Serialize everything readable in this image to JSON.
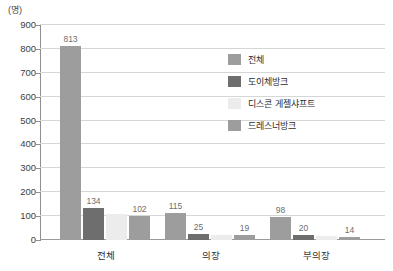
{
  "chart_data": {
    "type": "bar",
    "title": "",
    "subtitle": "",
    "unit_label": "(명)",
    "xlabel": "",
    "ylabel": "",
    "ylim": [
      0,
      900
    ],
    "ytick_step": 100,
    "grid": true,
    "legend_position": "inside-top-right",
    "categories": [
      "전체",
      "의장",
      "부의장"
    ],
    "yticks": [
      "0",
      "100",
      "200",
      "300",
      "400",
      "500",
      "600",
      "700",
      "800",
      "900"
    ],
    "series": [
      {
        "name": "전체",
        "color": "#9d9d9d",
        "values": [
          813,
          115,
          98
        ],
        "labels": [
          "813",
          "115",
          "98"
        ]
      },
      {
        "name": "도이체방크",
        "color": "#6e6e6e",
        "values": [
          134,
          25,
          20
        ],
        "labels": [
          "134",
          "25",
          "20"
        ]
      },
      {
        "name": "디스콘 게젤샤프트",
        "color": "#ececec",
        "values": [
          110,
          20,
          16
        ],
        "labels": [
          "",
          "",
          ""
        ]
      },
      {
        "name": "드레스너방크",
        "color": "#9d9d9d",
        "values": [
          102,
          19,
          14
        ],
        "labels": [
          "102",
          "19",
          "14"
        ]
      }
    ]
  }
}
